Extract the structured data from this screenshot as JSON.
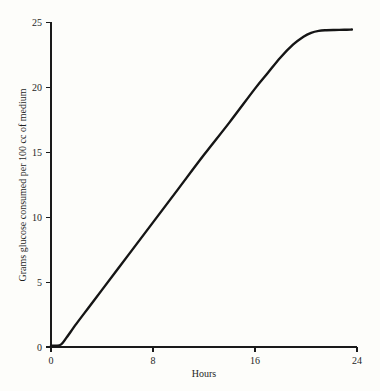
{
  "figure": {
    "background_color": "#fdfdfa",
    "ink_color": "#151515"
  },
  "chart_data": {
    "type": "line",
    "title": "",
    "subtitle": "",
    "xlabel": "Hours",
    "ylabel": "Grams glucose consumed per 100 cc of medium",
    "xlim": [
      0,
      24
    ],
    "ylim": [
      0,
      25
    ],
    "xticks": [
      0,
      8,
      16,
      24
    ],
    "xtick_labels": [
      "0",
      "8",
      "16",
      "24"
    ],
    "yticks": [
      0,
      5,
      10,
      15,
      20,
      25
    ],
    "ytick_labels": [
      "0",
      "5",
      "10",
      "15",
      "20",
      "25"
    ],
    "grid": false,
    "legend": null,
    "legend_position": "none",
    "annotations": [],
    "series": [
      {
        "name": "glucose consumed",
        "color": "#151515",
        "line_width": 2.4,
        "x": [
          0.0,
          0.4,
          0.8,
          1.2,
          2.0,
          3.0,
          4.0,
          6.0,
          8.0,
          10.0,
          12.0,
          14.0,
          16.0,
          17.0,
          18.0,
          19.0,
          19.8,
          20.4,
          21.0,
          21.6,
          22.2,
          23.0,
          23.6
        ],
        "y": [
          0.1,
          0.1,
          0.2,
          0.7,
          1.8,
          3.1,
          4.4,
          7.0,
          9.6,
          12.2,
          14.8,
          17.3,
          19.9,
          21.1,
          22.3,
          23.3,
          23.9,
          24.2,
          24.35,
          24.4,
          24.42,
          24.43,
          24.45
        ]
      }
    ]
  },
  "axes": {
    "x_tick_positions_px": [
      51,
      153,
      255,
      357
    ],
    "y_tick_positions_px": [
      347,
      282.4,
      217.4,
      152.4,
      87.4,
      22.4
    ],
    "origin_px": {
      "x": 51,
      "y": 347
    },
    "tick_length_px": 5
  }
}
